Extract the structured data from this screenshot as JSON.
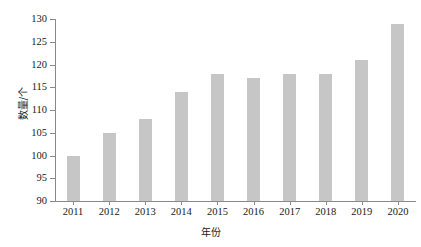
{
  "chart_data": {
    "type": "bar",
    "title": "",
    "xlabel": "年份",
    "ylabel": "数量/个",
    "categories": [
      "2011",
      "2012",
      "2013",
      "2014",
      "2015",
      "2016",
      "2017",
      "2018",
      "2019",
      "2020"
    ],
    "values": [
      100,
      105,
      108,
      114,
      118,
      117,
      118,
      118,
      121,
      129
    ],
    "ylim": [
      90,
      130
    ],
    "ytick_labels": [
      "90",
      "95",
      "100",
      "105",
      "110",
      "115",
      "120",
      "125",
      "130"
    ],
    "ytick_values": [
      90,
      95,
      100,
      105,
      110,
      115,
      120,
      125,
      130
    ],
    "grid": false,
    "legend": false,
    "bar_color": "#c6c6c6",
    "axis_color": "#8a8a8a",
    "text_color": "#1a1a1a",
    "background_color": "#ffffff"
  }
}
